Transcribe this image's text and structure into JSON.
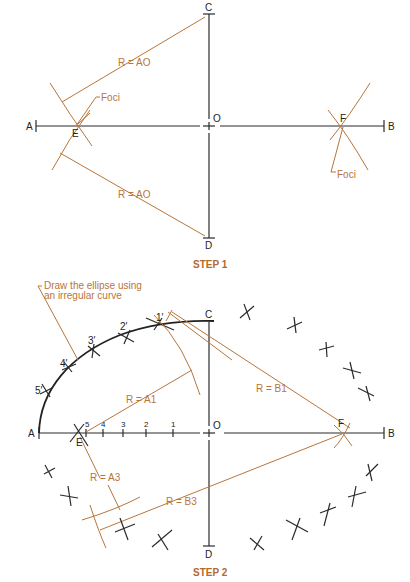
{
  "colors": {
    "ink": "#2a2a2a",
    "construction": "#b8753a",
    "step_title": "#b26a30"
  },
  "step1": {
    "title": "STEP 1",
    "points": {
      "A": "A",
      "B": "B",
      "C": "C",
      "D": "D",
      "O": "O",
      "E": "E",
      "F": "F"
    },
    "labels": {
      "radius_upper": "R = AO",
      "radius_lower": "R = AO",
      "foci_left": "Foci",
      "foci_right": "Foci"
    }
  },
  "step2": {
    "title": "STEP 2",
    "points": {
      "A": "A",
      "B": "B",
      "C": "C",
      "D": "D",
      "O": "O",
      "E": "E",
      "F": "F"
    },
    "divisions": [
      "5",
      "4",
      "3",
      "2",
      "1"
    ],
    "curve_points": [
      "1′",
      "2′",
      "3′",
      "4′",
      "5′"
    ],
    "labels": {
      "note_line1": "Draw the ellipse using",
      "note_line2": "an irregular curve",
      "r_a1": "R = A1",
      "r_b1": "R = B1",
      "r_a3": "R = A3",
      "r_b3": "R = B3"
    }
  }
}
